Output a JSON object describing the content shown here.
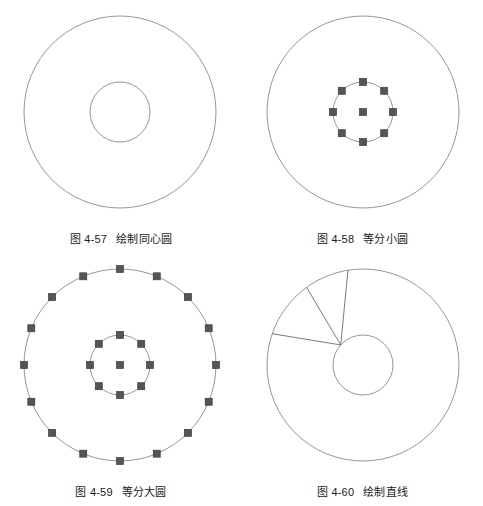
{
  "page": {
    "background_color": "#ffffff",
    "text_color": "#1a1a1a"
  },
  "style": {
    "circle_stroke": "#8a8a8a",
    "line_stroke": "#6b6b6b",
    "grip_fill": "#555555",
    "grip_stroke": "#3d3d3d",
    "stroke_width": 0.9,
    "grip_size": 7
  },
  "figures": [
    {
      "id": "fig-57",
      "number": "图 4-57",
      "title": "绘制同心圆",
      "caption": "图 4-57   绘制同心圆",
      "geometry": {
        "center": {
          "x": 120,
          "y": 112
        },
        "outer_radius": 96,
        "inner_radius": 30,
        "grips": false,
        "lines": []
      }
    },
    {
      "id": "fig-58",
      "number": "图 4-58",
      "title": "等分小圆",
      "caption": "图 4-58   等分小圆",
      "geometry": {
        "center": {
          "x": 121,
          "y": 112
        },
        "outer_radius": 96,
        "inner_radius": 30,
        "grips": true,
        "grip_divisions_inner": 8,
        "grip_divisions_outer": 0,
        "center_grip": true,
        "lines": []
      }
    },
    {
      "id": "fig-59",
      "number": "图 4-59",
      "title": "等分大圆",
      "caption": "图 4-59   等分大圆",
      "geometry": {
        "center": {
          "x": 120,
          "y": 112
        },
        "outer_radius": 96,
        "inner_radius": 30,
        "grips": true,
        "grip_divisions_inner": 8,
        "grip_divisions_outer": 16,
        "center_grip": true,
        "lines": []
      }
    },
    {
      "id": "fig-60",
      "number": "图 4-60",
      "title": "绘制直线",
      "caption": "图 4-60   绘制直线",
      "geometry": {
        "center": {
          "x": 121,
          "y": 112
        },
        "outer_radius": 96,
        "inner_radius": 30,
        "grips": false,
        "lines": [
          {
            "from_angle_deg": 138,
            "to_angle_deg": 99
          },
          {
            "from_angle_deg": 138,
            "to_angle_deg": 126
          },
          {
            "from_angle_deg": 138,
            "to_angle_deg": 161
          }
        ]
      }
    }
  ]
}
